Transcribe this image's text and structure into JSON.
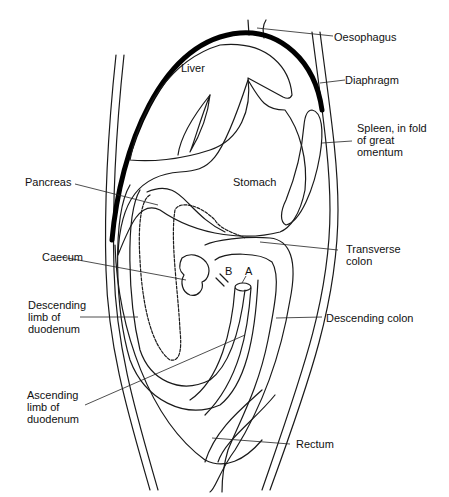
{
  "figure": {
    "type": "anatomical-diagram"
  },
  "labels": {
    "oesophagus": "Oesophagus",
    "diaphragm": "Diaphragm",
    "liver": "Liver",
    "spleen": "Spleen, in fold\nof great\nomentum",
    "stomach": "Stomach",
    "pancreas": "Pancreas",
    "transverse_colon": "Transverse\ncolon",
    "caecum": "Caecum",
    "marker_b": "B",
    "marker_a": "A",
    "descending_limb": "Descending\nlimb of\nduodenum",
    "descending_colon": "Descending colon",
    "ascending_limb": "Ascending\nlimb of\nduodenum",
    "rectum": "Rectum"
  },
  "colors": {
    "line": "#1a1a1a",
    "background": "#ffffff",
    "diaphragm": "#000000"
  }
}
